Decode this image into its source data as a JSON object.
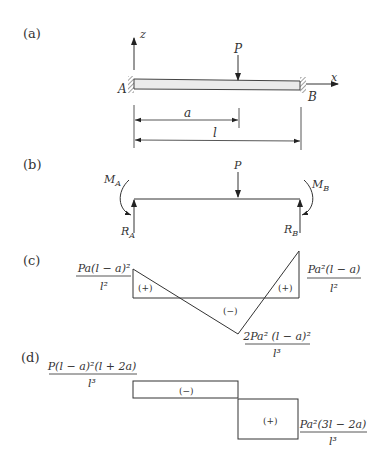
{
  "panels": {
    "a": {
      "label": "(a)",
      "axis_z": "z",
      "axis_x": "x",
      "load": "P",
      "support_left": "A",
      "support_right": "B",
      "dim_a": "a",
      "dim_l": "l"
    },
    "b": {
      "label": "(b)",
      "load": "P",
      "moment_left": "M",
      "moment_left_sub": "A",
      "moment_right": "M",
      "moment_right_sub": "B",
      "reaction_left": "R",
      "reaction_left_sub": "A",
      "reaction_right": "R",
      "reaction_right_sub": "B"
    },
    "c": {
      "label": "(c)",
      "left_value_num": "Pa(l − a)²",
      "left_value_den": "l²",
      "right_value_num": "Pa²(l − a)",
      "right_value_den": "l²",
      "min_value_num": "2Pa² (l − a)²",
      "min_value_den": "l³",
      "sign_left": "(+)",
      "sign_mid": "(−)",
      "sign_right": "(+)"
    },
    "d": {
      "label": "(d)",
      "left_value_num": "P(l − a)²(l + 2a)",
      "left_value_den": "l³",
      "right_value_num": "Pa²(3l − 2a)",
      "right_value_den": "l³",
      "sign_left": "(−)",
      "sign_right": "(+)"
    }
  }
}
